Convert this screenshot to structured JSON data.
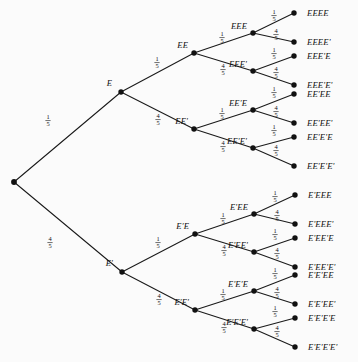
{
  "figure": {
    "background_color": "#fbfbfb",
    "ink_color": "#111111",
    "width": 358,
    "height": 362
  },
  "chart_data": {
    "type": "diagram",
    "subtype": "probability-tree",
    "depth": 4,
    "branch_labels": [
      "1/5",
      "4/5"
    ],
    "event_symbols": [
      "E",
      "E'"
    ],
    "probabilities": {
      "E": "1/5",
      "E_prime": "4/5"
    },
    "root": {
      "id": "root",
      "label": "",
      "x": 14,
      "y": 182
    },
    "nodes": [
      {
        "id": "E",
        "label": "E",
        "x": 121,
        "y": 92,
        "label_dx": -9,
        "label_dy": -6,
        "anchor": "end"
      },
      {
        "id": "Ep",
        "label": "E'",
        "x": 122,
        "y": 272,
        "label_dx": -9,
        "label_dy": -6,
        "anchor": "end"
      },
      {
        "id": "EE",
        "label": "EE",
        "x": 194,
        "y": 53,
        "label_dx": -6,
        "label_dy": -5,
        "anchor": "end"
      },
      {
        "id": "EEp",
        "label": "EE'",
        "x": 194,
        "y": 129,
        "label_dx": -6,
        "label_dy": -5,
        "anchor": "end"
      },
      {
        "id": "EpE",
        "label": "E'E",
        "x": 195,
        "y": 234,
        "label_dx": -6,
        "label_dy": -5,
        "anchor": "end"
      },
      {
        "id": "EpEp",
        "label": "E'E'",
        "x": 195,
        "y": 310,
        "label_dx": -6,
        "label_dy": -5,
        "anchor": "end"
      },
      {
        "id": "EEE",
        "label": "EEE",
        "x": 253,
        "y": 33,
        "label_dx": -6,
        "label_dy": -4,
        "anchor": "end"
      },
      {
        "id": "EEEp",
        "label": "EEE'",
        "x": 253,
        "y": 71,
        "label_dx": -6,
        "label_dy": -4,
        "anchor": "end"
      },
      {
        "id": "EEpE",
        "label": "EE'E",
        "x": 253,
        "y": 110,
        "label_dx": -6,
        "label_dy": -4,
        "anchor": "end"
      },
      {
        "id": "EEpEp",
        "label": "EE'E'",
        "x": 253,
        "y": 148,
        "label_dx": -6,
        "label_dy": -4,
        "anchor": "end"
      },
      {
        "id": "EpEE",
        "label": "E'EE",
        "x": 254,
        "y": 214,
        "label_dx": -6,
        "label_dy": -4,
        "anchor": "end"
      },
      {
        "id": "EpEEp",
        "label": "E'EE'",
        "x": 254,
        "y": 252,
        "label_dx": -6,
        "label_dy": -4,
        "anchor": "end"
      },
      {
        "id": "EpEpE",
        "label": "E'E'E",
        "x": 254,
        "y": 291,
        "label_dx": -6,
        "label_dy": -4,
        "anchor": "end"
      },
      {
        "id": "EpEpEp",
        "label": "E'E'E'",
        "x": 254,
        "y": 329,
        "label_dx": -6,
        "label_dy": -4,
        "anchor": "end"
      }
    ],
    "leaves": [
      {
        "id": "L1",
        "label": "EEEE",
        "x": 294,
        "y": 13
      },
      {
        "id": "L2",
        "label": "EEEE'",
        "x": 294,
        "y": 42
      },
      {
        "id": "L3",
        "label": "EEE'E",
        "x": 294,
        "y": 56
      },
      {
        "id": "L4",
        "label": "EEE'E'",
        "x": 294,
        "y": 85
      },
      {
        "id": "L5",
        "label": "EE'EE",
        "x": 294,
        "y": 94
      },
      {
        "id": "L6",
        "label": "EE'EE'",
        "x": 294,
        "y": 123
      },
      {
        "id": "L7",
        "label": "EE'E'E",
        "x": 294,
        "y": 137
      },
      {
        "id": "L8",
        "label": "EE'E'E'",
        "x": 294,
        "y": 166
      },
      {
        "id": "L9",
        "label": "E'EEE",
        "x": 295,
        "y": 195
      },
      {
        "id": "L10",
        "label": "E'EEE'",
        "x": 295,
        "y": 224
      },
      {
        "id": "L11",
        "label": "E'EE'E",
        "x": 295,
        "y": 238
      },
      {
        "id": "L12",
        "label": "E'EE'E'",
        "x": 295,
        "y": 267
      },
      {
        "id": "L13",
        "label": "E'E'EE",
        "x": 295,
        "y": 275
      },
      {
        "id": "L14",
        "label": "E'E'EE'",
        "x": 295,
        "y": 304
      },
      {
        "id": "L15",
        "label": "E'E'E'E",
        "x": 295,
        "y": 318
      },
      {
        "id": "L16",
        "label": "E'E'E'E'",
        "x": 295,
        "y": 347
      }
    ],
    "edges": [
      {
        "from": "root",
        "to": "E",
        "num": "1",
        "den": "5",
        "fx": 48,
        "fy": 120
      },
      {
        "from": "root",
        "to": "Ep",
        "num": "4",
        "den": "5",
        "fx": 50,
        "fy": 242
      },
      {
        "from": "E",
        "to": "EE",
        "num": "1",
        "den": "5",
        "fx": 157,
        "fy": 62
      },
      {
        "from": "E",
        "to": "EEp",
        "num": "4",
        "den": "5",
        "fx": 158,
        "fy": 119
      },
      {
        "from": "Ep",
        "to": "EpE",
        "num": "1",
        "den": "5",
        "fx": 158,
        "fy": 242
      },
      {
        "from": "Ep",
        "to": "EpEp",
        "num": "4",
        "den": "5",
        "fx": 159,
        "fy": 299
      },
      {
        "from": "EE",
        "to": "EEE",
        "num": "1",
        "den": "5",
        "fx": 222,
        "fy": 37
      },
      {
        "from": "EE",
        "to": "EEEp",
        "num": "4",
        "den": "5",
        "fx": 223,
        "fy": 69
      },
      {
        "from": "EEp",
        "to": "EEpE",
        "num": "1",
        "den": "5",
        "fx": 222,
        "fy": 113
      },
      {
        "from": "EEp",
        "to": "EEpEp",
        "num": "4",
        "den": "5",
        "fx": 223,
        "fy": 146
      },
      {
        "from": "EpE",
        "to": "EpEE",
        "num": "1",
        "den": "5",
        "fx": 223,
        "fy": 218
      },
      {
        "from": "EpE",
        "to": "EpEEp",
        "num": "4",
        "den": "5",
        "fx": 224,
        "fy": 250
      },
      {
        "from": "EpEp",
        "to": "EpEpE",
        "num": "1",
        "den": "5",
        "fx": 223,
        "fy": 294
      },
      {
        "from": "EpEp",
        "to": "EpEpEp",
        "num": "4",
        "den": "5",
        "fx": 224,
        "fy": 327
      },
      {
        "from": "EEE",
        "to": "L1",
        "num": "1",
        "den": "5",
        "fx": 274,
        "fy": 15
      },
      {
        "from": "EEE",
        "to": "L2",
        "num": "4",
        "den": "5",
        "fx": 276,
        "fy": 34
      },
      {
        "from": "EEEp",
        "to": "L3",
        "num": "1",
        "den": "5",
        "fx": 274,
        "fy": 53
      },
      {
        "from": "EEEp",
        "to": "L4",
        "num": "4",
        "den": "5",
        "fx": 276,
        "fy": 72
      },
      {
        "from": "EEpE",
        "to": "L5",
        "num": "1",
        "den": "5",
        "fx": 274,
        "fy": 92
      },
      {
        "from": "EEpE",
        "to": "L6",
        "num": "4",
        "den": "5",
        "fx": 276,
        "fy": 111
      },
      {
        "from": "EEpEp",
        "to": "L7",
        "num": "1",
        "den": "5",
        "fx": 274,
        "fy": 130
      },
      {
        "from": "EEpEp",
        "to": "L8",
        "num": "4",
        "den": "5",
        "fx": 276,
        "fy": 150
      },
      {
        "from": "EpEE",
        "to": "L9",
        "num": "1",
        "den": "5",
        "fx": 275,
        "fy": 196
      },
      {
        "from": "EpEE",
        "to": "L10",
        "num": "4",
        "den": "5",
        "fx": 277,
        "fy": 215
      },
      {
        "from": "EpEEp",
        "to": "L11",
        "num": "1",
        "den": "5",
        "fx": 275,
        "fy": 234
      },
      {
        "from": "EpEEp",
        "to": "L12",
        "num": "4",
        "den": "5",
        "fx": 277,
        "fy": 253
      },
      {
        "from": "EpEpE",
        "to": "L13",
        "num": "1",
        "den": "5",
        "fx": 275,
        "fy": 273
      },
      {
        "from": "EpEpE",
        "to": "L14",
        "num": "4",
        "den": "5",
        "fx": 277,
        "fy": 292
      },
      {
        "from": "EpEpEp",
        "to": "L15",
        "num": "1",
        "den": "5",
        "fx": 275,
        "fy": 311
      },
      {
        "from": "EpEpEp",
        "to": "L16",
        "num": "4",
        "den": "5",
        "fx": 277,
        "fy": 331
      }
    ]
  }
}
